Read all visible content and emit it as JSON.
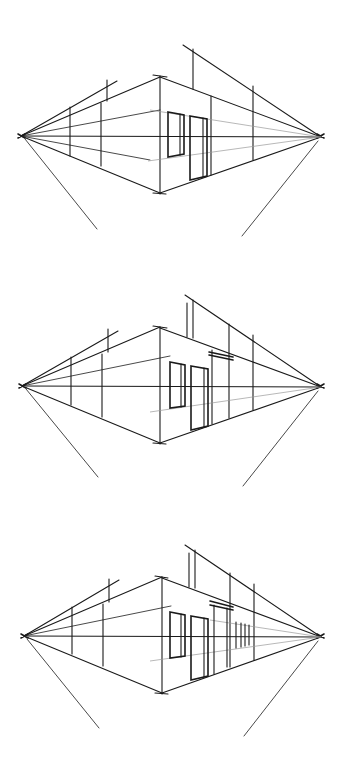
{
  "image": {
    "description": "Three stacked two-point perspective sketches showing progressive construction of a building corner with windows and doors",
    "background": "#ffffff",
    "ink_color": "#1a1a1a",
    "panels": [
      {
        "id": "sketch-1",
        "stage": "basic box with window and door",
        "horizon_y": 136,
        "vp_left": [
          21,
          136
        ],
        "vp_right": [
          321,
          136
        ],
        "corner_x": 160
      },
      {
        "id": "sketch-2",
        "stage": "adds canopy over second door",
        "horizon_y": 386,
        "vp_left": [
          22,
          386
        ],
        "vp_right": [
          321,
          386
        ],
        "corner_x": 160
      },
      {
        "id": "sketch-3",
        "stage": "adds recessed window bays on right wall",
        "horizon_y": 636,
        "vp_left": [
          24,
          636
        ],
        "vp_right": [
          321,
          636
        ],
        "corner_x": 162
      }
    ]
  }
}
